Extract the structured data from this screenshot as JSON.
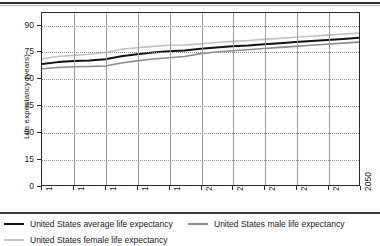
{
  "chart_data": {
    "type": "line",
    "title": "",
    "xlabel": "",
    "ylabel": "Life expectancy (years)",
    "xlim": [
      1950,
      2050
    ],
    "ylim": [
      0,
      97
    ],
    "grid": true,
    "legend_position": "bottom",
    "x": [
      1950,
      1955,
      1960,
      1965,
      1970,
      1975,
      1980,
      1985,
      1990,
      1995,
      2000,
      2005,
      2010,
      2015,
      2020,
      2025,
      2030,
      2035,
      2040,
      2045,
      2050
    ],
    "xticks": [
      "1950",
      "1960",
      "1970",
      "1980",
      "1990",
      "2000",
      "2010",
      "2020",
      "2030",
      "2040",
      "2050"
    ],
    "yticks": [
      "0",
      "15",
      "30",
      "45",
      "60",
      "75",
      "90"
    ],
    "series": [
      {
        "name": "United States average life expectancy",
        "color": "#111111",
        "width": 2.0,
        "values": [
          68.2,
          69.3,
          69.9,
          70.2,
          70.9,
          72.6,
          73.7,
          74.7,
          75.4,
          75.8,
          76.8,
          77.6,
          78.2,
          78.7,
          79.4,
          80.0,
          80.6,
          81.2,
          81.8,
          82.4,
          83.0
        ]
      },
      {
        "name": "United States male life expectancy",
        "color": "#8c8c8c",
        "width": 1.6,
        "values": [
          65.6,
          66.3,
          66.7,
          66.8,
          67.1,
          68.8,
          70.0,
          71.1,
          71.8,
          72.5,
          74.1,
          75.0,
          75.7,
          76.3,
          77.0,
          77.6,
          78.2,
          78.8,
          79.4,
          80.0,
          80.6
        ]
      },
      {
        "name": "United States female life expectancy",
        "color": "#c2c2c2",
        "width": 1.6,
        "values": [
          71.1,
          72.5,
          73.1,
          73.7,
          74.7,
          76.6,
          77.4,
          78.2,
          78.8,
          78.9,
          79.6,
          80.4,
          81.0,
          81.5,
          82.1,
          82.7,
          83.3,
          83.9,
          84.5,
          85.1,
          85.7
        ]
      }
    ]
  },
  "legend": {
    "items": [
      {
        "label": "United States average life expectancy",
        "color": "#111111",
        "thickness": 2
      },
      {
        "label": "United States male life expectancy",
        "color": "#8c8c8c",
        "thickness": 2
      },
      {
        "label": "United States female life expectancy",
        "color": "#c2c2c2",
        "thickness": 2
      }
    ]
  }
}
